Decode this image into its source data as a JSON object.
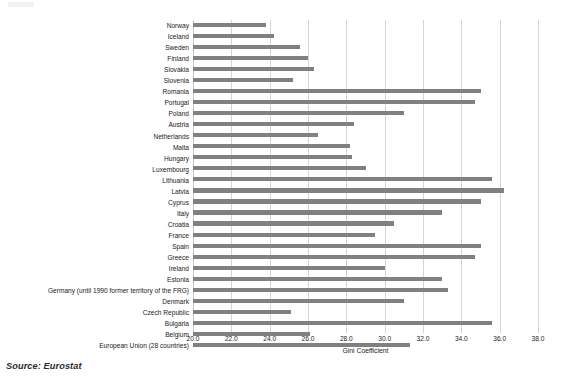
{
  "source_note": "Source: Eurostat",
  "axis": {
    "title": "Gini Coefficient",
    "ticks": [
      "20.0",
      "22.0",
      "24.0",
      "26.0",
      "28.0",
      "30.0",
      "32.0",
      "34.0",
      "36.0",
      "38.0"
    ],
    "tick_values": [
      20.0,
      22.0,
      24.0,
      26.0,
      28.0,
      30.0,
      32.0,
      34.0,
      36.0,
      38.0
    ]
  },
  "style": {
    "bar_color": "#808080",
    "grid_color": "#d4d4d4",
    "text_color": "#1a1a1a"
  },
  "chart_data": {
    "type": "bar",
    "orientation": "horizontal",
    "title": "",
    "xlabel": "Gini Coefficient",
    "ylabel": "",
    "xlim": [
      20.0,
      38.0
    ],
    "grid": true,
    "legend": null,
    "categories": [
      "Norway",
      "Iceland",
      "Sweden",
      "Finland",
      "Slovakia",
      "Slovenia",
      "Romania",
      "Portugal",
      "Poland",
      "Austria",
      "Netherlands",
      "Malta",
      "Hungary",
      "Luxembourg",
      "Lithuania",
      "Latvia",
      "Cyprus",
      "Italy",
      "Croatia",
      "France",
      "Spain",
      "Greece",
      "Ireland",
      "Estonia",
      "Germany (until 1990 former territory of the FRG)",
      "Denmark",
      "Czech Republic",
      "Bulgaria",
      "Belgium",
      "European Union (28 countries)"
    ],
    "values": [
      23.8,
      24.2,
      25.6,
      26.0,
      26.3,
      25.2,
      35.0,
      34.7,
      31.0,
      28.4,
      26.5,
      28.2,
      28.3,
      29.0,
      35.6,
      36.2,
      35.0,
      33.0,
      30.5,
      29.5,
      35.0,
      34.7,
      30.0,
      33.0,
      33.3,
      31.0,
      25.1,
      35.6,
      26.1,
      31.3
    ]
  }
}
